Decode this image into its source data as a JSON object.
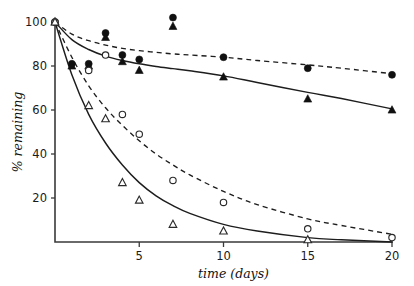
{
  "chart_data": {
    "type": "scatter",
    "title": "",
    "subtitle": "",
    "xlabel": "time (days)",
    "ylabel": "% remaining",
    "xlim": [
      0,
      20
    ],
    "ylim": [
      0,
      100
    ],
    "xticks": [
      5,
      10,
      15,
      20
    ],
    "xtick_labels": [
      "5",
      "10",
      "15",
      "20"
    ],
    "yticks": [
      20,
      40,
      60,
      80,
      100
    ],
    "ytick_labels": [
      "20",
      "40",
      "60",
      "80",
      "100"
    ],
    "grid": false,
    "legend_position": "none",
    "annotations": [],
    "series": [
      {
        "name": "filled-circle",
        "marker": "filled circle",
        "line_style": "dashed",
        "points": [
          {
            "x": 0,
            "y": 100
          },
          {
            "x": 1,
            "y": 81
          },
          {
            "x": 2,
            "y": 81
          },
          {
            "x": 3,
            "y": 95
          },
          {
            "x": 4,
            "y": 85
          },
          {
            "x": 5,
            "y": 83
          },
          {
            "x": 7,
            "y": 102
          },
          {
            "x": 10,
            "y": 84
          },
          {
            "x": 15,
            "y": 79
          },
          {
            "x": 20,
            "y": 76
          }
        ],
        "fit_curve": {
          "style": "dashed",
          "model": "exponential-plus-offset",
          "x": [
            0,
            1,
            2,
            3,
            4,
            5,
            6,
            7,
            8,
            10,
            12,
            15,
            17,
            20
          ],
          "y": [
            100,
            94.5,
            91.5,
            89.5,
            88,
            87,
            86.2,
            85.5,
            85,
            84,
            82.5,
            80.5,
            79,
            76.5
          ]
        }
      },
      {
        "name": "filled-triangle",
        "marker": "filled triangle",
        "line_style": "solid",
        "points": [
          {
            "x": 0,
            "y": 100
          },
          {
            "x": 1,
            "y": 80
          },
          {
            "x": 2,
            "y": 80
          },
          {
            "x": 3,
            "y": 93
          },
          {
            "x": 4,
            "y": 82
          },
          {
            "x": 5,
            "y": 78
          },
          {
            "x": 7,
            "y": 98
          },
          {
            "x": 10,
            "y": 75
          },
          {
            "x": 15,
            "y": 65
          },
          {
            "x": 20,
            "y": 60
          }
        ],
        "fit_curve": {
          "style": "solid",
          "model": "exponential-plus-offset",
          "x": [
            0,
            1,
            2,
            3,
            4,
            5,
            6,
            7,
            8,
            10,
            12,
            15,
            17,
            20
          ],
          "y": [
            100,
            92,
            87.5,
            84.5,
            82.5,
            81,
            79.8,
            78.8,
            77.8,
            75.5,
            72.5,
            68,
            65.2,
            60.5
          ]
        }
      },
      {
        "name": "open-circle",
        "marker": "open circle",
        "line_style": "dashed",
        "points": [
          {
            "x": 0,
            "y": 100
          },
          {
            "x": 2,
            "y": 78
          },
          {
            "x": 3,
            "y": 85
          },
          {
            "x": 4,
            "y": 58
          },
          {
            "x": 5,
            "y": 49
          },
          {
            "x": 7,
            "y": 28
          },
          {
            "x": 10,
            "y": 18
          },
          {
            "x": 15,
            "y": 6
          },
          {
            "x": 20,
            "y": 2
          }
        ],
        "fit_curve": {
          "style": "dashed",
          "model": "exponential-decay",
          "x": [
            0,
            1,
            2,
            3,
            4,
            5,
            6,
            7,
            8,
            10,
            12,
            15,
            17,
            20
          ],
          "y": [
            100,
            84,
            71,
            61,
            53,
            46,
            40,
            35,
            30.5,
            23,
            17,
            10.5,
            7.5,
            3.5
          ]
        }
      },
      {
        "name": "open-triangle",
        "marker": "open triangle",
        "line_style": "solid",
        "points": [
          {
            "x": 0,
            "y": 100
          },
          {
            "x": 2,
            "y": 62
          },
          {
            "x": 3,
            "y": 56
          },
          {
            "x": 4,
            "y": 27
          },
          {
            "x": 5,
            "y": 19
          },
          {
            "x": 7,
            "y": 8
          },
          {
            "x": 10,
            "y": 5
          },
          {
            "x": 15,
            "y": 1
          }
        ],
        "fit_curve": {
          "style": "solid",
          "model": "exponential-decay",
          "x": [
            0,
            1,
            2,
            3,
            4,
            5,
            6,
            7,
            8,
            10,
            12,
            15,
            17,
            20
          ],
          "y": [
            100,
            76,
            58,
            45,
            35,
            27,
            21,
            16.5,
            13,
            8,
            5,
            2,
            1,
            0
          ]
        }
      }
    ]
  },
  "axes": {
    "x_title": "time (days)",
    "y_title": "% remaining"
  },
  "colors": {
    "axis": "#3a3a3a",
    "curve": "#1d1d1d",
    "marker_fill": "#101010",
    "marker_open_fill": "#ffffff",
    "background": "#ffffff"
  }
}
